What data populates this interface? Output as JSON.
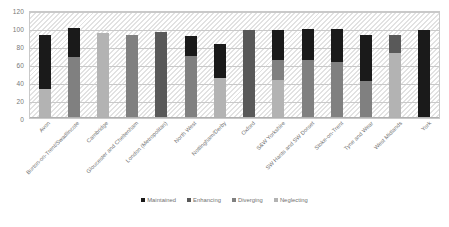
{
  "chart_data": {
    "type": "bar",
    "subtype": "stacked-bar",
    "title": "",
    "xlabel": "",
    "ylabel": "",
    "ylim": [
      0,
      120
    ],
    "yticks": [
      0,
      20,
      40,
      60,
      80,
      100,
      120
    ],
    "grid": true,
    "legend_position": "bottom",
    "categories": [
      "Avon",
      "Burton-on-Trent/Swadlincote",
      "Cambridge",
      "Gloucester and Cheltenham",
      "London (Metropolitan)",
      "North West",
      "Nottingham/Derby",
      "Oxford",
      "S&W Yorkshire",
      "SW Hants and SW Dorset",
      "Stoke-on-Trent",
      "Tyne and Wear",
      "West Midlands",
      "York"
    ],
    "series": [
      {
        "name": "Maintained",
        "color": "#1a1a1a",
        "values": [
          60,
          32,
          0,
          0,
          0,
          22,
          37,
          0,
          33,
          35,
          37,
          51,
          0,
          98
        ]
      },
      {
        "name": "Enhancing",
        "color": "#595959",
        "values": [
          0,
          0,
          0,
          0,
          96,
          0,
          0,
          98,
          0,
          0,
          0,
          0,
          20,
          0
        ]
      },
      {
        "name": "Diverging",
        "color": "#808080",
        "values": [
          0,
          68,
          0,
          92,
          0,
          69,
          0,
          0,
          23,
          64,
          62,
          41,
          0,
          0
        ]
      },
      {
        "name": "Neglecting",
        "color": "#b3b3b3",
        "values": [
          32,
          0,
          95,
          0,
          0,
          0,
          45,
          0,
          42,
          0,
          0,
          0,
          72,
          0
        ]
      }
    ]
  },
  "legend": {
    "items": [
      {
        "label": "Maintained",
        "color": "#1a1a1a"
      },
      {
        "label": "Enhancing",
        "color": "#595959"
      },
      {
        "label": "Diverging",
        "color": "#808080"
      },
      {
        "label": "Neglecting",
        "color": "#b3b3b3"
      }
    ]
  }
}
